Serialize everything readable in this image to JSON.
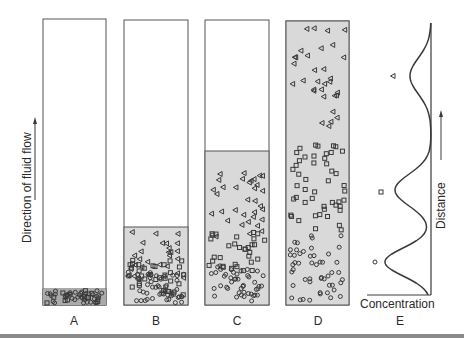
{
  "figure": {
    "axis_left_label": "Direction of fluid flow",
    "columns": [
      {
        "id": "A",
        "label": "A",
        "x": 43,
        "top": 19,
        "width": 63,
        "bottom": 305,
        "fill_top": 289,
        "particles": {
          "triangle": 0,
          "square": 12,
          "circle": 40,
          "region": [
            290,
            304
          ]
        }
      },
      {
        "id": "B",
        "label": "B",
        "x": 124,
        "top": 20,
        "width": 64,
        "bottom": 305,
        "fill_top": 227,
        "particles": {
          "triangle_band": [
            232,
            280
          ],
          "triangle": 30,
          "square_band": [
            260,
            295
          ],
          "square": 35,
          "circle_band": [
            272,
            303
          ],
          "circle": 45
        }
      },
      {
        "id": "C",
        "label": "C",
        "x": 205,
        "top": 20,
        "width": 64,
        "bottom": 305,
        "fill_top": 151,
        "particles": {
          "triangle_band": [
            172,
            240
          ],
          "triangle": 34,
          "square_band": [
            232,
            272
          ],
          "square": 32,
          "circle_band": [
            265,
            302
          ],
          "circle": 45
        }
      },
      {
        "id": "D",
        "label": "D",
        "x": 286,
        "top": 21,
        "width": 63,
        "bottom": 305,
        "fill_top": 21,
        "particles": {
          "triangle_band": [
            26,
            128
          ],
          "triangle": 32,
          "square_band": [
            145,
            230
          ],
          "square": 48,
          "circle_band": [
            235,
            302
          ],
          "circle": 50
        }
      }
    ],
    "panel_e": {
      "label": "E",
      "xlabel": "Concentration",
      "ylabel": "Distance",
      "peaks": [
        {
          "species": "triangle",
          "y": 76,
          "concentration_px": 21,
          "marker_x": 393
        },
        {
          "species": "square",
          "y": 190,
          "concentration_px": 36,
          "marker_x": 381
        },
        {
          "species": "circle",
          "y": 262,
          "concentration_px": 46,
          "marker_x": 375
        }
      ],
      "axis_x": 431,
      "axis_top": 23,
      "axis_bottom": 295,
      "base_left": 367
    },
    "colors": {
      "fill": "#d9d9d9",
      "line": "#3a3a3a",
      "band": "#8a8a8a"
    }
  }
}
